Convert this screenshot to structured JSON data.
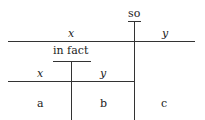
{
  "diagram": {
    "type": "nested-tree",
    "top": {
      "connective": "so",
      "left_label": "x",
      "right_label": "y"
    },
    "inner": {
      "connective": "in fact",
      "left_label": "x",
      "right_label": "y"
    },
    "leaves": [
      "a",
      "b",
      "c"
    ]
  }
}
